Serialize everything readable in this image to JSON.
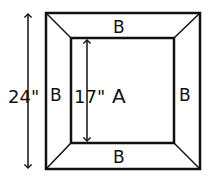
{
  "diagram": {
    "outer_dimension": "24\"",
    "inner_dimension": "17\"",
    "center_label": "A",
    "border_labels": {
      "top": "B",
      "left": "B",
      "right": "B",
      "bottom": "B"
    },
    "colors": {
      "stroke": "#111111",
      "background": "#ffffff"
    }
  }
}
